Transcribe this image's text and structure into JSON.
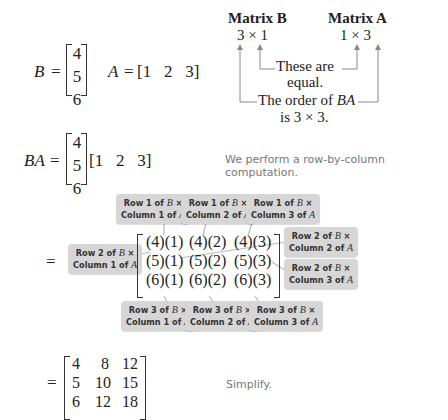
{
  "header_right": {
    "matrix_b_label": "Matrix B",
    "matrix_a_label": "Matrix A",
    "b_order": "3 × 1",
    "a_order": "1 × 3",
    "inner_note_line1": "These are",
    "inner_note_line2": "equal.",
    "outer_note_line1_prefix": "The order of ",
    "outer_note_line1_var": "BA",
    "outer_note_line2": "is 3 × 3."
  },
  "definitions": {
    "b_label": "B",
    "equals": "=",
    "b_entries": [
      "4",
      "5",
      "6"
    ],
    "a_label": "A",
    "a_row": "[1   2   3]"
  },
  "product_setup": {
    "label": "BA",
    "equals": "=",
    "b_entries": [
      "4",
      "5",
      "6"
    ],
    "a_row": "[1   2   3]",
    "note": "We perform a row-by-column computation."
  },
  "computation": {
    "equals": "=",
    "cells": [
      [
        "(4)(1)",
        "(4)(2)",
        "(4)(3)"
      ],
      [
        "(5)(1)",
        "(5)(2)",
        "(5)(3)"
      ],
      [
        "(6)(1)",
        "(6)(2)",
        "(6)(3)"
      ]
    ],
    "callouts": {
      "r1c1": {
        "line1": "Row 1 of ",
        "var1": "B",
        "times": " ×",
        "line2": "Column 1 of ",
        "var2": "A"
      },
      "r1c2": {
        "line1": "Row 1 of ",
        "var1": "B",
        "times": " ×",
        "line2": "Column 2 of ",
        "var2": "A"
      },
      "r1c3": {
        "line1": "Row 1 of ",
        "var1": "B",
        "times": " ×",
        "line2": "Column 3 of ",
        "var2": "A"
      },
      "r2c1": {
        "line1": "Row 2 of ",
        "var1": "B",
        "times": " ×",
        "line2": "Column 1 of ",
        "var2": "A"
      },
      "r2c2": {
        "line1": "Row 2 of ",
        "var1": "B",
        "times": " ×",
        "line2": "Column 2 of ",
        "var2": "A"
      },
      "r2c3": {
        "line1": "Row 2 of ",
        "var1": "B",
        "times": " ×",
        "line2": "Column 3 of ",
        "var2": "A"
      },
      "r3c1": {
        "line1": "Row 3 of ",
        "var1": "B",
        "times": " ×",
        "line2": "Column 1 of ",
        "var2": "A"
      },
      "r3c2": {
        "line1": "Row 3 of ",
        "var1": "B",
        "times": " ×",
        "line2": "Column 2 of ",
        "var2": "A"
      },
      "r3c3": {
        "line1": "Row 3 of ",
        "var1": "B",
        "times": " ×",
        "line2": "Column 3 of ",
        "var2": "A"
      }
    }
  },
  "result": {
    "equals": "=",
    "rows": [
      [
        "4",
        "8",
        "12"
      ],
      [
        "5",
        "10",
        "15"
      ],
      [
        "6",
        "12",
        "18"
      ]
    ],
    "note": "Simplify."
  },
  "colors": {
    "callout_bg": "#d6d6d6",
    "note_text": "#777777",
    "leader_line": "#bbbbbb"
  }
}
